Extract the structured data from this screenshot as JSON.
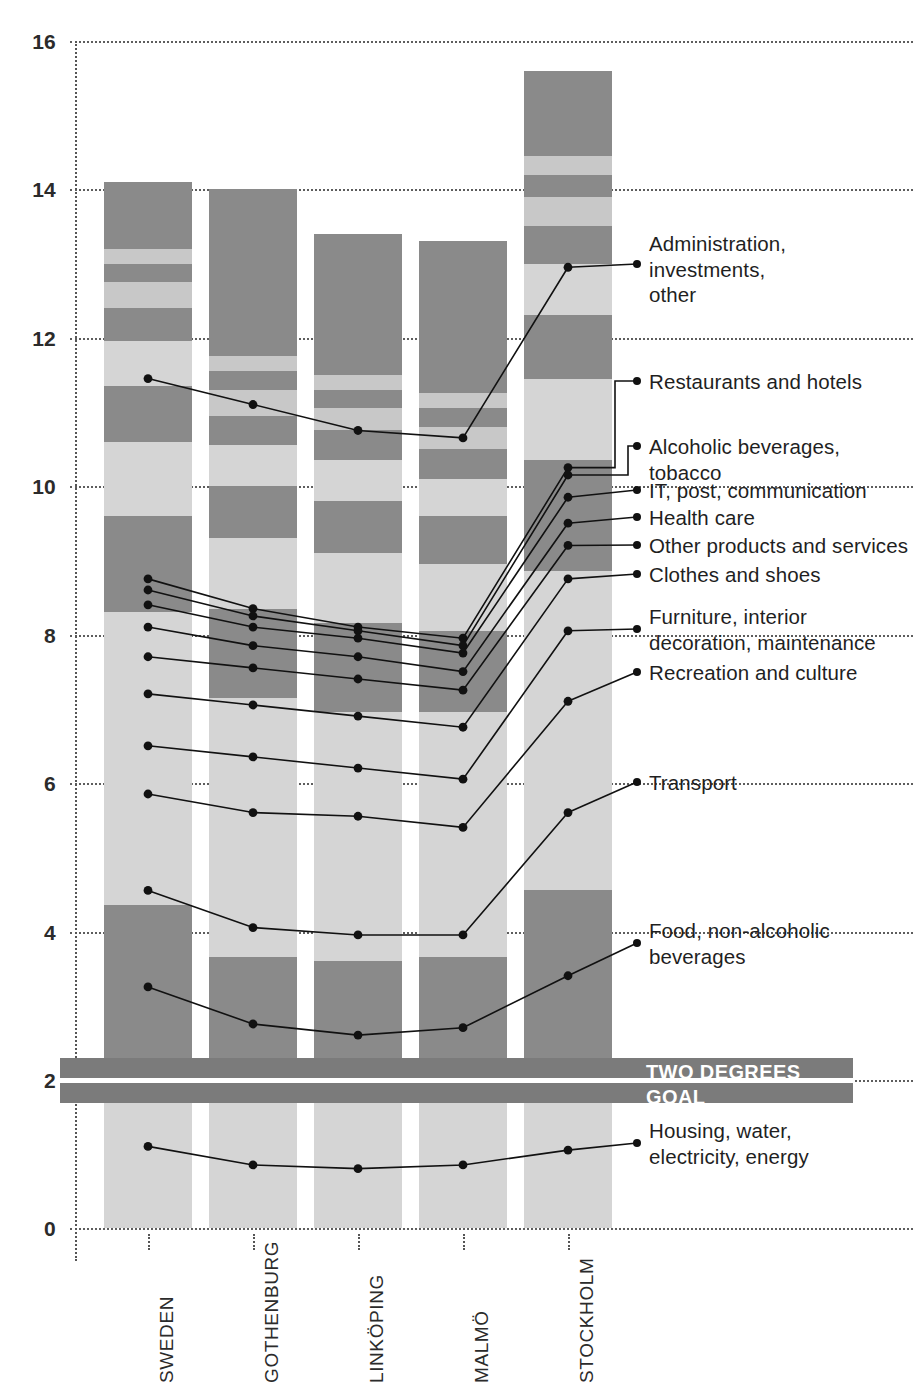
{
  "chart_data": {
    "type": "bar",
    "stacked": true,
    "title": "",
    "subtitle": "",
    "xlabel": "",
    "ylabel": "",
    "ylim": [
      0,
      16
    ],
    "ytick_step": 2,
    "ytick_labels": [
      "0",
      "2",
      "4",
      "6",
      "8",
      "10",
      "12",
      "14",
      "16"
    ],
    "grid": true,
    "grid_style": "dotted",
    "legend_position": "right-callouts",
    "categories": [
      "SWEDEN",
      "GOTHENBURG",
      "LINKÖPING",
      "MALMÖ",
      "STOCKHOLM"
    ],
    "totals": [
      14.1,
      13.8,
      13.4,
      13.3,
      15.6
    ],
    "series": [
      {
        "name": "Housing, water, electricity, energy",
        "values": [
          2.2,
          1.8,
          1.7,
          1.8,
          2.2
        ]
      },
      {
        "name": "Food, non-alcoholic beverages",
        "values": [
          2.15,
          1.85,
          1.9,
          1.85,
          2.35
        ]
      },
      {
        "name": "Transport",
        "values": [
          3.95,
          3.5,
          3.35,
          3.3,
          4.3
        ]
      },
      {
        "name": "Recreation and culture",
        "values": [
          1.3,
          1.2,
          1.2,
          1.1,
          1.5
        ]
      },
      {
        "name": "Furniture, interior decoration, maintenance",
        "values": [
          1.0,
          0.95,
          0.95,
          0.9,
          1.1
        ]
      },
      {
        "name": "Clothes and shoes",
        "values": [
          0.75,
          0.7,
          0.7,
          0.65,
          0.85
        ]
      },
      {
        "name": "Other products and services",
        "values": [
          0.6,
          0.55,
          0.55,
          0.5,
          0.7
        ]
      },
      {
        "name": "Health care",
        "values": [
          0.45,
          0.4,
          0.4,
          0.4,
          0.5
        ]
      },
      {
        "name": "IT, post, communication",
        "values": [
          0.35,
          0.35,
          0.3,
          0.3,
          0.4
        ]
      },
      {
        "name": "Alcoholic beverages, tobacco",
        "values": [
          0.25,
          0.25,
          0.25,
          0.25,
          0.3
        ]
      },
      {
        "name": "Restaurants and hotels",
        "values": [
          0.2,
          0.2,
          0.2,
          0.2,
          0.25
        ]
      },
      {
        "name": "Administration, investments, other",
        "values": [
          0.9,
          2.25,
          1.9,
          2.05,
          1.15
        ]
      }
    ],
    "marker_line_values": {
      "Administration, investments, other": [
        11.45,
        11.1,
        10.75,
        10.65,
        12.95
      ],
      "Restaurants and hotels": [
        8.75,
        8.35,
        8.1,
        7.95,
        10.25
      ],
      "Alcoholic beverages, tobacco": [
        8.6,
        8.25,
        8.05,
        7.85,
        10.15
      ],
      "IT, post, communication": [
        8.4,
        8.1,
        7.95,
        7.75,
        9.85
      ],
      "Health care": [
        8.1,
        7.85,
        7.7,
        7.5,
        9.5
      ],
      "Other products and services": [
        7.7,
        7.55,
        7.4,
        7.25,
        9.2
      ],
      "Clothes and shoes": [
        7.2,
        7.05,
        6.9,
        6.75,
        8.75
      ],
      "Furniture, interior decoration, maintenance": [
        6.5,
        6.35,
        6.2,
        6.05,
        8.05
      ],
      "Recreation and culture": [
        5.85,
        5.6,
        5.55,
        5.4,
        7.1
      ],
      "Transport": [
        4.55,
        4.05,
        3.95,
        3.95,
        5.6
      ],
      "Food, non-alcoholic beverages": [
        3.25,
        2.75,
        2.6,
        2.7,
        3.4
      ],
      "Housing, water, electricity, energy": [
        1.1,
        0.85,
        0.8,
        0.85,
        1.05
      ]
    },
    "annotations": [
      {
        "label": "TWO DEGREES\nGOAL",
        "value_band": [
          1.7,
          2.3
        ],
        "goal_value": 2.0
      }
    ],
    "colors": {
      "light_gray": "#d5d5d5",
      "mid_light_gray": "#c8c8c8",
      "dark_gray": "#8a8a8a",
      "band_gray": "#7b7b7b",
      "marker": "#111111",
      "grid": "#555555",
      "text": "#1f1f1f"
    }
  },
  "axis": {
    "y_ticks": [
      "16",
      "14",
      "12",
      "10",
      "8",
      "6",
      "4",
      "2",
      "0"
    ],
    "x_ticks": [
      "SWEDEN",
      "GOTHENBURG",
      "LINKÖPING",
      "MALMÖ",
      "STOCKHOLM"
    ]
  },
  "callouts": [
    {
      "id": "administration",
      "text": "Administration,\ninvestments,\nother"
    },
    {
      "id": "restaurants",
      "text": "Restaurants and hotels"
    },
    {
      "id": "alcohol",
      "text": "Alcoholic beverages, tobacco"
    },
    {
      "id": "it-post",
      "text": "IT, post, communication"
    },
    {
      "id": "health-care",
      "text": "Health care"
    },
    {
      "id": "other-products",
      "text": "Other products and services"
    },
    {
      "id": "clothes",
      "text": "Clothes and shoes"
    },
    {
      "id": "furniture",
      "text": "Furniture, interior\ndecoration, maintenance"
    },
    {
      "id": "recreation",
      "text": "Recreation and culture"
    },
    {
      "id": "transport",
      "text": "Transport"
    },
    {
      "id": "food",
      "text": "Food, non-alcoholic\nbeverages"
    },
    {
      "id": "housing",
      "text": "Housing, water,\nelectricity, energy"
    }
  ],
  "two_degrees": {
    "line1": "TWO DEGREES",
    "line2": "GOAL"
  }
}
